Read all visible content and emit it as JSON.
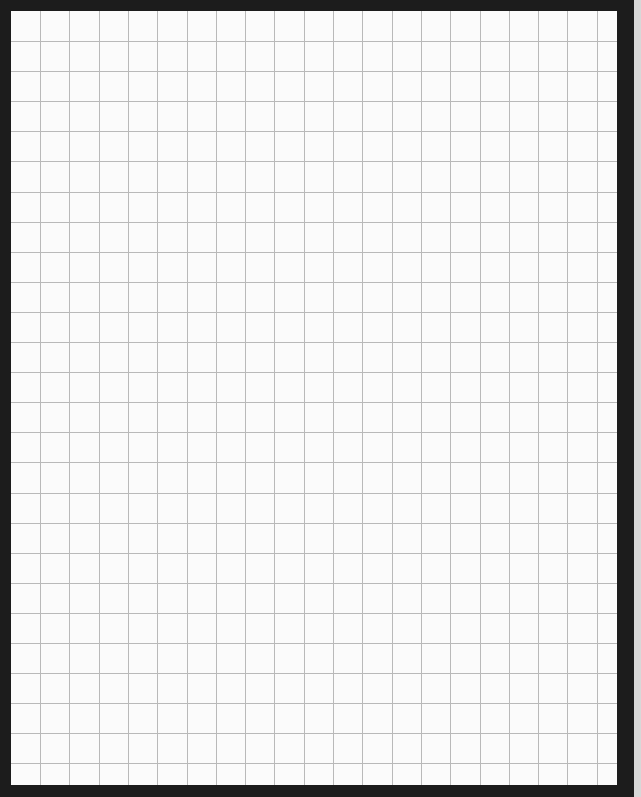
{
  "sheet": {
    "type": "graph-paper",
    "border_color": "#1c1c1c",
    "paper_color": "#fbfbfb",
    "grid_color": "#b9b9b9",
    "columns": 21,
    "rows": 26,
    "cell_size_px": 29.3
  }
}
